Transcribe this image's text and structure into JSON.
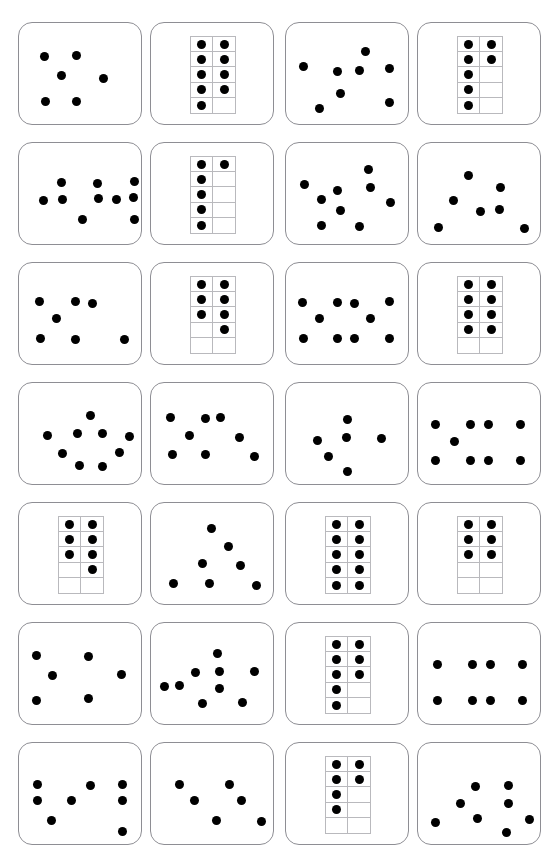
{
  "document": {
    "title": "Dot pattern and ten-frame quantity cards worksheet",
    "header_fragment": "",
    "page_width": 557,
    "page_height": 865,
    "background_color": "#ffffff",
    "dot_color": "#000000",
    "card_border_color": "#8e8e94",
    "frame_line_color": "#b9b9bd"
  },
  "grid": {
    "columns": 4,
    "rows": 7,
    "card_width": 124,
    "card_height": 103,
    "col_x": [
      18,
      150,
      285,
      417
    ],
    "row_y": [
      8,
      128,
      248,
      368,
      488,
      608,
      728
    ]
  },
  "cards": [
    {
      "index": 1,
      "row": 1,
      "col": 1,
      "type": "scatter",
      "count": 6,
      "label": "six-dots-scattered",
      "dots": [
        [
          25,
          33
        ],
        [
          57,
          32
        ],
        [
          42,
          52
        ],
        [
          84,
          55
        ],
        [
          26,
          78
        ],
        [
          57,
          78
        ]
      ]
    },
    {
      "index": 2,
      "row": 1,
      "col": 2,
      "type": "tenframe",
      "count": 9,
      "label": "ten-frame-nine",
      "filled": [
        true,
        true,
        true,
        true,
        true,
        true,
        true,
        true,
        true,
        false
      ]
    },
    {
      "index": 3,
      "row": 1,
      "col": 3,
      "type": "scatter",
      "count": 8,
      "label": "eight-dots-scattered",
      "dots": [
        [
          79,
          28
        ],
        [
          17,
          43
        ],
        [
          51,
          48
        ],
        [
          73,
          47
        ],
        [
          103,
          45
        ],
        [
          54,
          70
        ],
        [
          33,
          85
        ],
        [
          103,
          79
        ]
      ]
    },
    {
      "index": 4,
      "row": 1,
      "col": 4,
      "type": "tenframe",
      "count": 7,
      "label": "ten-frame-seven",
      "filled": [
        true,
        true,
        true,
        true,
        true,
        false,
        true,
        false,
        true,
        false
      ]
    },
    {
      "index": 5,
      "row": 2,
      "col": 1,
      "type": "scatter",
      "count": 10,
      "label": "ten-dots-scattered",
      "dots": [
        [
          42,
          39
        ],
        [
          78,
          40
        ],
        [
          115,
          38
        ],
        [
          24,
          57
        ],
        [
          43,
          56
        ],
        [
          79,
          55
        ],
        [
          97,
          56
        ],
        [
          114,
          54
        ],
        [
          63,
          76
        ],
        [
          115,
          76
        ]
      ]
    },
    {
      "index": 6,
      "row": 2,
      "col": 2,
      "type": "tenframe",
      "count": 6,
      "label": "ten-frame-six",
      "filled": [
        true,
        true,
        true,
        false,
        true,
        false,
        true,
        false,
        true,
        false
      ]
    },
    {
      "index": 7,
      "row": 2,
      "col": 3,
      "type": "scatter",
      "count": 9,
      "label": "nine-dots-scattered",
      "dots": [
        [
          82,
          26
        ],
        [
          18,
          41
        ],
        [
          51,
          47
        ],
        [
          84,
          44
        ],
        [
          35,
          56
        ],
        [
          54,
          67
        ],
        [
          104,
          59
        ],
        [
          35,
          82
        ],
        [
          73,
          83
        ]
      ]
    },
    {
      "index": 8,
      "row": 2,
      "col": 4,
      "type": "scatter",
      "count": 7,
      "label": "seven-dots-scattered",
      "dots": [
        [
          50,
          32
        ],
        [
          82,
          44
        ],
        [
          35,
          57
        ],
        [
          62,
          68
        ],
        [
          81,
          66
        ],
        [
          20,
          84
        ],
        [
          106,
          85
        ]
      ]
    },
    {
      "index": 9,
      "row": 3,
      "col": 1,
      "type": "scatter",
      "count": 7,
      "label": "seven-dots-scattered",
      "dots": [
        [
          20,
          38
        ],
        [
          56,
          38
        ],
        [
          73,
          40
        ],
        [
          37,
          55
        ],
        [
          21,
          75
        ],
        [
          56,
          76
        ],
        [
          105,
          76
        ]
      ]
    },
    {
      "index": 10,
      "row": 3,
      "col": 2,
      "type": "tenframe",
      "count": 7,
      "label": "ten-frame-seven-right",
      "filled": [
        true,
        true,
        true,
        true,
        true,
        true,
        false,
        true,
        false,
        false
      ]
    },
    {
      "index": 11,
      "row": 3,
      "col": 3,
      "type": "scatter",
      "count": 10,
      "label": "ten-dots-scattered",
      "dots": [
        [
          16,
          39
        ],
        [
          51,
          39
        ],
        [
          68,
          40
        ],
        [
          103,
          38
        ],
        [
          33,
          55
        ],
        [
          84,
          55
        ],
        [
          17,
          75
        ],
        [
          51,
          75
        ],
        [
          68,
          75
        ],
        [
          103,
          75
        ]
      ]
    },
    {
      "index": 12,
      "row": 3,
      "col": 4,
      "type": "tenframe",
      "count": 8,
      "label": "ten-frame-eight",
      "filled": [
        true,
        true,
        true,
        true,
        true,
        true,
        true,
        true,
        false,
        false
      ]
    },
    {
      "index": 13,
      "row": 4,
      "col": 1,
      "type": "scatter",
      "count": 9,
      "label": "nine-dots-scattered",
      "dots": [
        [
          71,
          32
        ],
        [
          28,
          52
        ],
        [
          58,
          50
        ],
        [
          83,
          50
        ],
        [
          110,
          53
        ],
        [
          43,
          70
        ],
        [
          100,
          69
        ],
        [
          60,
          82
        ],
        [
          83,
          83
        ]
      ]
    },
    {
      "index": 14,
      "row": 4,
      "col": 2,
      "type": "scatter",
      "count": 9,
      "label": "nine-dots-scattered",
      "dots": [
        [
          19,
          34
        ],
        [
          54,
          35
        ],
        [
          69,
          34
        ],
        [
          38,
          52
        ],
        [
          88,
          54
        ],
        [
          21,
          71
        ],
        [
          54,
          71
        ],
        [
          103,
          73
        ]
      ]
    },
    {
      "index": 15,
      "row": 4,
      "col": 3,
      "type": "scatter",
      "count": 6,
      "label": "six-dots-scattered",
      "dots": [
        [
          61,
          36
        ],
        [
          60,
          54
        ],
        [
          31,
          57
        ],
        [
          95,
          55
        ],
        [
          42,
          73
        ],
        [
          61,
          88
        ]
      ]
    },
    {
      "index": 16,
      "row": 4,
      "col": 4,
      "type": "scatter",
      "count": 9,
      "label": "nine-dots-scattered",
      "dots": [
        [
          17,
          41
        ],
        [
          52,
          41
        ],
        [
          70,
          41
        ],
        [
          102,
          41
        ],
        [
          36,
          58
        ],
        [
          17,
          77
        ],
        [
          52,
          77
        ],
        [
          70,
          77
        ],
        [
          102,
          77
        ]
      ]
    },
    {
      "index": 17,
      "row": 5,
      "col": 1,
      "type": "tenframe",
      "count": 7,
      "label": "ten-frame-seven-mixed",
      "filled": [
        true,
        true,
        true,
        true,
        true,
        true,
        false,
        true,
        false,
        false
      ]
    },
    {
      "index": 18,
      "row": 5,
      "col": 2,
      "type": "scatter",
      "count": 7,
      "label": "seven-dots-scattered",
      "dots": [
        [
          60,
          25
        ],
        [
          77,
          43
        ],
        [
          51,
          60
        ],
        [
          89,
          62
        ],
        [
          22,
          80
        ],
        [
          58,
          80
        ],
        [
          105,
          82
        ]
      ]
    },
    {
      "index": 19,
      "row": 5,
      "col": 3,
      "type": "tenframe",
      "count": 10,
      "label": "ten-frame-ten",
      "filled": [
        true,
        true,
        true,
        true,
        true,
        true,
        true,
        true,
        true,
        true
      ]
    },
    {
      "index": 20,
      "row": 5,
      "col": 4,
      "type": "tenframe",
      "count": 6,
      "label": "ten-frame-six",
      "filled": [
        true,
        true,
        true,
        true,
        true,
        true,
        false,
        false,
        false,
        false
      ]
    },
    {
      "index": 21,
      "row": 6,
      "col": 1,
      "type": "scatter",
      "count": 6,
      "label": "six-dots-scattered",
      "dots": [
        [
          17,
          32
        ],
        [
          69,
          33
        ],
        [
          33,
          52
        ],
        [
          102,
          51
        ],
        [
          17,
          77
        ],
        [
          69,
          75
        ]
      ]
    },
    {
      "index": 22,
      "row": 6,
      "col": 2,
      "type": "scatter",
      "count": 10,
      "label": "ten-dots-scattered",
      "dots": [
        [
          66,
          30
        ],
        [
          44,
          49
        ],
        [
          68,
          48
        ],
        [
          103,
          48
        ],
        [
          13,
          63
        ],
        [
          28,
          62
        ],
        [
          68,
          65
        ],
        [
          51,
          80
        ],
        [
          91,
          79
        ]
      ]
    },
    {
      "index": 23,
      "row": 6,
      "col": 3,
      "type": "tenframe",
      "count": 8,
      "label": "ten-frame-eight",
      "filled": [
        true,
        true,
        true,
        true,
        true,
        true,
        true,
        false,
        true,
        false
      ]
    },
    {
      "index": 24,
      "row": 6,
      "col": 4,
      "type": "scatter",
      "count": 8,
      "label": "eight-dots-two-rows",
      "dots": [
        [
          19,
          41
        ],
        [
          54,
          41
        ],
        [
          72,
          41
        ],
        [
          104,
          41
        ],
        [
          19,
          77
        ],
        [
          54,
          77
        ],
        [
          72,
          77
        ],
        [
          104,
          77
        ]
      ]
    },
    {
      "index": 25,
      "row": 7,
      "col": 1,
      "type": "scatter",
      "count": 8,
      "label": "eight-dots-scattered",
      "dots": [
        [
          18,
          41
        ],
        [
          71,
          42
        ],
        [
          103,
          41
        ],
        [
          18,
          57
        ],
        [
          52,
          57
        ],
        [
          103,
          57
        ],
        [
          32,
          77
        ],
        [
          103,
          88
        ]
      ]
    },
    {
      "index": 26,
      "row": 7,
      "col": 2,
      "type": "scatter",
      "count": 6,
      "label": "six-dots-scattered",
      "dots": [
        [
          28,
          41
        ],
        [
          78,
          41
        ],
        [
          43,
          57
        ],
        [
          90,
          57
        ],
        [
          65,
          77
        ],
        [
          110,
          78
        ]
      ]
    },
    {
      "index": 27,
      "row": 7,
      "col": 3,
      "type": "tenframe",
      "count": 6,
      "label": "ten-frame-six-mixed",
      "filled": [
        true,
        true,
        true,
        true,
        true,
        false,
        true,
        false,
        false,
        false
      ]
    },
    {
      "index": 28,
      "row": 7,
      "col": 4,
      "type": "scatter",
      "count": 8,
      "label": "eight-dots-scattered",
      "dots": [
        [
          57,
          43
        ],
        [
          90,
          42
        ],
        [
          42,
          60
        ],
        [
          90,
          60
        ],
        [
          59,
          75
        ],
        [
          17,
          79
        ],
        [
          111,
          76
        ],
        [
          88,
          89
        ]
      ]
    }
  ]
}
